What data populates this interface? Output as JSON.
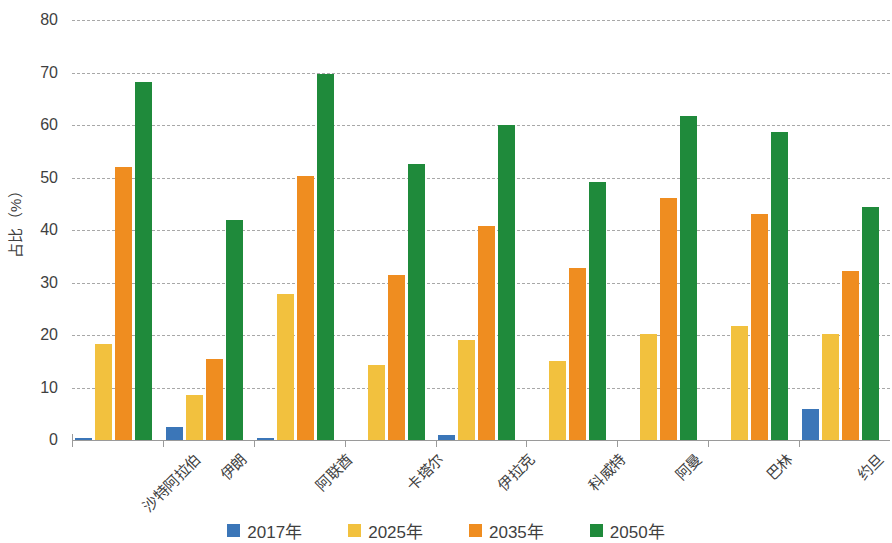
{
  "chart_data": {
    "type": "bar",
    "title": "",
    "subtitle": "",
    "xlabel": "",
    "ylabel": "占比（%）",
    "ylim": [
      0,
      80
    ],
    "yticks": [
      0,
      10,
      20,
      30,
      40,
      50,
      60,
      70,
      80
    ],
    "ytick_labels": [
      "0",
      "10",
      "20",
      "30",
      "40",
      "50",
      "60",
      "70",
      "80"
    ],
    "grid": true,
    "grid_style": "dashed horizontal",
    "legend_position": "bottom",
    "categories": [
      "沙特阿拉伯",
      "伊朗",
      "阿联酋",
      "卡塔尔",
      "伊拉克",
      "科威特",
      "阿曼",
      "巴林",
      "约旦"
    ],
    "series": [
      {
        "name": "2017年",
        "color": "#3b76b8",
        "values": [
          0.3,
          2.5,
          0.3,
          0,
          1.0,
          0,
          0,
          0,
          6.0
        ]
      },
      {
        "name": "2025年",
        "color": "#f2c13e",
        "values": [
          18.3,
          8.5,
          27.8,
          14.2,
          19.0,
          15.0,
          20.2,
          21.8,
          20.2
        ]
      },
      {
        "name": "2035年",
        "color": "#ef8d20",
        "values": [
          52.0,
          15.5,
          50.3,
          31.5,
          40.8,
          32.8,
          46.1,
          43.0,
          32.2
        ]
      },
      {
        "name": "2050年",
        "color": "#1f8a3b",
        "values": [
          68.2,
          42.0,
          69.8,
          52.5,
          60.0,
          49.2,
          61.7,
          58.7,
          44.4
        ]
      }
    ]
  }
}
